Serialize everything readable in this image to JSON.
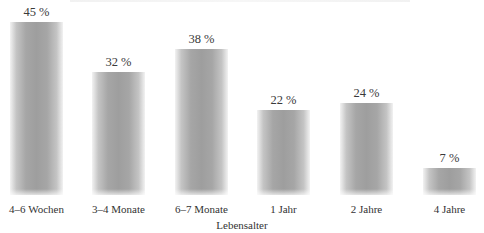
{
  "chart_data": {
    "type": "bar",
    "title": "",
    "xlabel": "Lebensalter",
    "ylabel": "",
    "categories": [
      "4–6 Wochen",
      "3–4 Monate",
      "6–7 Monate",
      "1 Jahr",
      "2 Jahre",
      "4 Jahre"
    ],
    "values": [
      45,
      32,
      38,
      22,
      24,
      7
    ],
    "value_labels": [
      "45 %",
      "32 %",
      "38 %",
      "22 %",
      "24 %",
      "7 %"
    ],
    "unit": "%",
    "ylim": [
      0,
      45
    ],
    "grid": false,
    "legend": null,
    "bar_color": "#a3a3a3"
  }
}
